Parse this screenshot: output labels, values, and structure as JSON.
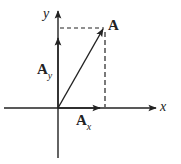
{
  "diagram": {
    "type": "vector-components",
    "axes": {
      "x_label": "x",
      "y_label": "y"
    },
    "vector": {
      "label": "A"
    },
    "components": {
      "x": {
        "base": "A",
        "subscript": "x"
      },
      "y": {
        "base": "A",
        "subscript": "y"
      }
    },
    "colors": {
      "stroke": "#222222",
      "background": "#ffffff"
    }
  }
}
